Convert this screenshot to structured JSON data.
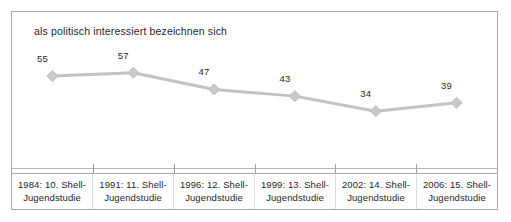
{
  "chart_data": {
    "type": "line",
    "title": "als politisch interessiert bezeichnen sich",
    "xlabel": "",
    "ylabel": "",
    "ylim": [
      0,
      70
    ],
    "grid": false,
    "legend": "none",
    "categories": [
      "1984: 10. Shell-Jugendstudie",
      "1991: 11. Shell-Jugendstudie",
      "1996: 12. Shell-Jugendstudie",
      "1999: 13. Shell-Jugendstudie",
      "2002: 14. Shell-Jugendstudie",
      "2006: 15. Shell-Jugendstudie"
    ],
    "category_lines": [
      {
        "line1": "1984: 10. Shell-",
        "line2": "Jugendstudie"
      },
      {
        "line1": "1991: 11. Shell-",
        "line2": "Jugendstudie"
      },
      {
        "line1": "1996: 12. Shell-",
        "line2": "Jugendstudie"
      },
      {
        "line1": "1999: 13. Shell-",
        "line2": "Jugendstudie"
      },
      {
        "line1": "2002: 14. Shell-",
        "line2": "Jugendstudie"
      },
      {
        "line1": "2006: 15. Shell-",
        "line2": "Jugendstudie"
      }
    ],
    "values": [
      55,
      57,
      47,
      43,
      34,
      39
    ],
    "value_labels": [
      "55",
      "57",
      "47",
      "43",
      "34",
      "39"
    ],
    "marker": "diamond",
    "colors": {
      "line": "#c3c3c3",
      "marker": "#c9c9c9",
      "marker_edge": "#bdbdbd",
      "axis": "#b6b6b6",
      "frame": "#a8a8a8",
      "text": "#1f1f1f"
    }
  }
}
